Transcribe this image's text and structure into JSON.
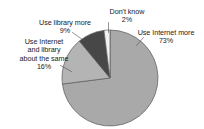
{
  "chart_data": {
    "type": "pie",
    "title": "",
    "categories": [
      "Use Internet more",
      "Use Internet and library about the same",
      "Use library more",
      "Don't know"
    ],
    "values": [
      73,
      16,
      9,
      2
    ],
    "unit": "%",
    "legend_position": "none",
    "labels_outside": true,
    "leader_lines": true,
    "start_angle_deg": 0,
    "direction": "clockwise",
    "slice_colors": [
      "#a9a9a9",
      "#b4b4b4",
      "#474747",
      "#f2f2f2"
    ],
    "annotations": [
      {
        "name": "Use Internet more",
        "value": 73,
        "text_line_1": "Use Internet more",
        "text_line_2": "73%"
      },
      {
        "name": "Use Internet and library about the same",
        "value": 16,
        "text_line_1": "Use Internet",
        "text_line_2": "and library",
        "text_line_3": "about the same",
        "text_line_4": "16%"
      },
      {
        "name": "Use library more",
        "value": 9,
        "text_line_1": "Use library more",
        "text_line_2": "9%"
      },
      {
        "name": "Don't know",
        "value": 2,
        "text_line_1": "Don't know",
        "text_line_2": "2%"
      }
    ]
  },
  "labels": {
    "dont_know": {
      "name": "Don't know",
      "pct": "2%",
      "full": "Don't know\n2%"
    },
    "use_library_more": {
      "name": "Use library more",
      "pct": "9%",
      "full": "Use library more\n9%"
    },
    "about_the_same": {
      "line1": "Use Internet",
      "line2": "and library",
      "line3": "about the same",
      "pct": "16%",
      "full": "Use Internet\nand library\nabout the same\n16%"
    },
    "use_internet_more": {
      "name": "Use Internet more",
      "pct": "73%",
      "full": "Use Internet more\n73%"
    }
  },
  "style": {
    "background": "#ffffff",
    "text_color": "#1a1a1a",
    "leader_color": "#4d4d4d",
    "slice_internet_more": "#a9a9a9",
    "slice_same": "#b4b4b4",
    "slice_library_more": "#474747",
    "slice_dont_know": "#f2f2f2",
    "slice_outline": "#5a5a5a"
  }
}
